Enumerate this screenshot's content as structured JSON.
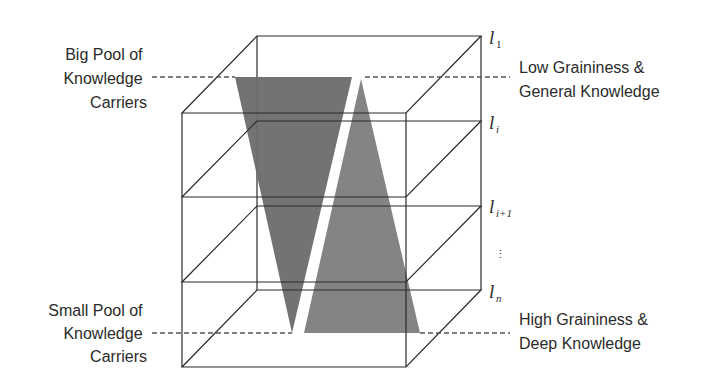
{
  "labels": {
    "top_left": [
      "Big Pool of",
      "Knowledge",
      "Carriers"
    ],
    "bottom_left": [
      "Small Pool of",
      "Knowledge",
      "Carriers"
    ],
    "top_right": [
      "Low Graininess &",
      "General Knowledge"
    ],
    "bottom_right": [
      "High Graininess &",
      "Deep Knowledge"
    ]
  },
  "layers": [
    {
      "name": "l",
      "sub": "1"
    },
    {
      "name": "l",
      "sub": "i"
    },
    {
      "name": "l",
      "sub": "i+1"
    },
    {
      "name": "ellipsis",
      "sub": "⋮"
    },
    {
      "name": "l",
      "sub": "n"
    }
  ],
  "colors": {
    "triangle_left": "#6b6b6b",
    "triangle_right": "#7d7d7d",
    "edge": "#2a2a2a",
    "dash": "#555555"
  },
  "shapes": {
    "left_triangle": "inverted (wide top = big pool, narrow bottom = small pool)",
    "right_triangle": "upright (narrow top = low graininess, wide bottom = high graininess)"
  }
}
